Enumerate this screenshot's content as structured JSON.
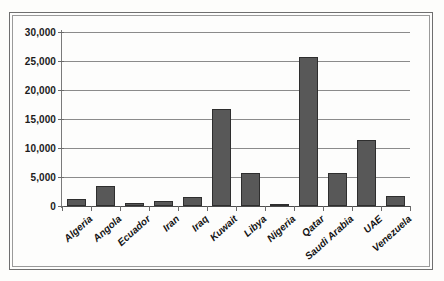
{
  "chart_data": {
    "type": "bar",
    "title": "",
    "xlabel": "",
    "ylabel": "",
    "categories": [
      "Algeria",
      "Angola",
      "Ecuador",
      "Iran",
      "Iraq",
      "Kuwait",
      "Libya",
      "Nigeria",
      "Qatar",
      "Saudi Arabia",
      "UAE",
      "Venezuela"
    ],
    "values": [
      1200,
      3400,
      600,
      900,
      1500,
      16800,
      5700,
      300,
      25700,
      5700,
      11400,
      1700
    ],
    "ylim": [
      0,
      30000
    ],
    "yticks": [
      0,
      5000,
      10000,
      15000,
      20000,
      25000,
      30000
    ],
    "ytick_labels": [
      "0",
      "5,000",
      "10,000",
      "15,000",
      "20,000",
      "25,000",
      "30,000"
    ],
    "grid": true,
    "legend": false,
    "legend_position": "none",
    "bar_color": "#585858",
    "bar_edge_color": "#2e2e2e",
    "gridline_color": "#8b8b8b",
    "axis_color": "#4d4d4d",
    "label_rotation": -42
  }
}
